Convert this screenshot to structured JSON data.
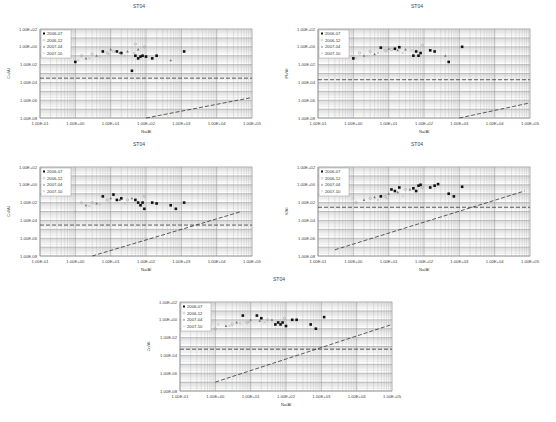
{
  "figure": {
    "caption": "",
    "station": "ST04"
  },
  "legend_entries": [
    "2006-07",
    "2006-12",
    "2007-04",
    "2007-10"
  ],
  "chart_data": [
    {
      "type": "scatter",
      "title": "ST04",
      "xlabel": "Na/Al",
      "ylabel": "Cu/Al",
      "xscale": "log",
      "yscale": "log",
      "xlim": [
        0.1,
        100000
      ],
      "ylim": [
        1e-08,
        100
      ],
      "xticks": [
        "1.00E-01",
        "1.00E+00",
        "1.00E+01",
        "1.00E+02",
        "1.00E+03",
        "1.00E+04",
        "1.00E+05"
      ],
      "yticks": [
        "1.00E+02",
        "1.00E+00",
        "1.00E-02",
        "1.00E-04",
        "1.00E-06",
        "1.00E-08"
      ],
      "legend": [
        "2006-07",
        "2006-12",
        "2007-04",
        "2007-10"
      ],
      "legend_position": "upper-left",
      "grid": true,
      "hline": 0.0003,
      "diag_line": [
        [
          100,
          1e-08
        ],
        [
          100000,
          2e-06
        ]
      ],
      "series": [
        {
          "name": "2006-07",
          "marker": "filled-square",
          "points": [
            [
              1,
              0.02
            ],
            [
              6,
              0.3
            ],
            [
              15,
              0.3
            ],
            [
              20,
              0.2
            ],
            [
              50,
              0.1
            ],
            [
              60,
              0.05
            ],
            [
              70,
              0.08
            ],
            [
              80,
              0.1
            ],
            [
              100,
              0.08
            ],
            [
              150,
              0.05
            ],
            [
              200,
              0.1
            ],
            [
              1200,
              0.3
            ],
            [
              40,
              0.002
            ]
          ]
        },
        {
          "name": "2006-12",
          "marker": "open-circle",
          "points": [
            [
              1.5,
              0.1
            ],
            [
              3,
              0.15
            ],
            [
              8,
              0.2
            ],
            [
              12,
              0.3
            ],
            [
              50,
              2
            ],
            [
              90,
              1
            ]
          ]
        },
        {
          "name": "2007-04",
          "marker": "triangle",
          "points": [
            [
              2,
              0.05
            ],
            [
              4,
              0.1
            ],
            [
              10,
              0.5
            ],
            [
              18,
              0.2
            ],
            [
              30,
              0.3
            ],
            [
              60,
              0.5
            ],
            [
              500,
              0.03
            ]
          ]
        },
        {
          "name": "2007-10",
          "marker": "cross",
          "points": [
            [
              1.2,
              0.03
            ],
            [
              2.5,
              0.05
            ],
            [
              5,
              0.08
            ],
            [
              9,
              0.15
            ],
            [
              25,
              0.1
            ],
            [
              45,
              0.2
            ]
          ]
        }
      ]
    },
    {
      "type": "scatter",
      "title": "ST04",
      "xlabel": "Na/Al",
      "ylabel": "Pb/Al",
      "xscale": "log",
      "yscale": "log",
      "xlim": [
        0.1,
        100000
      ],
      "ylim": [
        1e-08,
        100
      ],
      "xticks": [
        "1.00E-01",
        "1.00E+00",
        "1.00E+01",
        "1.00E+02",
        "1.00E+03",
        "1.00E+04",
        "1.00E+05"
      ],
      "yticks": [
        "1.00E+02",
        "1.00E+00",
        "1.00E-02",
        "1.00E-04",
        "1.00E-06",
        "1.00E-08"
      ],
      "legend": [
        "2006-07",
        "2006-12",
        "2007-04",
        "2007-10"
      ],
      "legend_position": "upper-left",
      "grid": true,
      "hline": 0.0002,
      "diag_line": [
        [
          1000,
          1e-08
        ],
        [
          100000,
          5e-07
        ]
      ],
      "series": [
        {
          "name": "2006-07",
          "marker": "filled-square",
          "points": [
            [
              1,
              0.05
            ],
            [
              6,
              0.8
            ],
            [
              15,
              0.6
            ],
            [
              20,
              0.9
            ],
            [
              50,
              0.1
            ],
            [
              60,
              0.3
            ],
            [
              70,
              0.1
            ],
            [
              80,
              0.2
            ],
            [
              150,
              0.4
            ],
            [
              200,
              0.3
            ],
            [
              500,
              0.02
            ],
            [
              1200,
              1
            ]
          ]
        },
        {
          "name": "2006-12",
          "marker": "open-circle",
          "points": [
            [
              1.5,
              0.2
            ],
            [
              3,
              0.3
            ],
            [
              8,
              0.4
            ],
            [
              12,
              0.5
            ],
            [
              90,
              1.5
            ]
          ]
        },
        {
          "name": "2007-04",
          "marker": "triangle",
          "points": [
            [
              2,
              0.1
            ],
            [
              4,
              0.15
            ],
            [
              10,
              0.6
            ],
            [
              18,
              0.4
            ],
            [
              30,
              0.5
            ],
            [
              400,
              0.1
            ]
          ]
        },
        {
          "name": "2007-10",
          "marker": "cross",
          "points": [
            [
              1.2,
              0.05
            ],
            [
              2.5,
              0.1
            ],
            [
              5,
              0.2
            ],
            [
              9,
              0.3
            ],
            [
              25,
              0.2
            ],
            [
              45,
              0.4
            ]
          ]
        }
      ]
    },
    {
      "type": "scatter",
      "title": "ST04",
      "xlabel": "Na/Al",
      "ylabel": "Cd/Al",
      "xscale": "log",
      "yscale": "log",
      "xlim": [
        0.1,
        100000
      ],
      "ylim": [
        1e-08,
        100
      ],
      "xticks": [
        "1.00E-01",
        "1.00E+00",
        "1.00E+01",
        "1.00E+02",
        "1.00E+03",
        "1.00E+04",
        "1.00E+05"
      ],
      "yticks": [
        "1.00E+02",
        "1.00E+00",
        "1.00E-02",
        "1.00E-04",
        "1.00E-06",
        "1.00E-08"
      ],
      "legend": [
        "2006-07",
        "2006-12",
        "2007-04",
        "2007-10"
      ],
      "legend_position": "upper-left",
      "grid": true,
      "hline": 3e-05,
      "diag_line": [
        [
          3,
          1e-08
        ],
        [
          50000,
          0.001
        ]
      ],
      "series": [
        {
          "name": "2006-07",
          "marker": "filled-square",
          "points": [
            [
              6,
              0.05
            ],
            [
              12,
              0.08
            ],
            [
              15,
              0.02
            ],
            [
              20,
              0.03
            ],
            [
              50,
              0.02
            ],
            [
              60,
              0.01
            ],
            [
              70,
              0.005
            ],
            [
              80,
              0.01
            ],
            [
              90,
              0.002
            ],
            [
              150,
              0.01
            ],
            [
              200,
              0.008
            ],
            [
              500,
              0.005
            ],
            [
              700,
              0.002
            ],
            [
              1200,
              0.01
            ]
          ]
        },
        {
          "name": "2006-12",
          "marker": "open-circle",
          "points": [
            [
              1.5,
              0.01
            ],
            [
              3,
              0.01
            ],
            [
              8,
              0.02
            ],
            [
              30,
              0.02
            ],
            [
              90,
              0.05
            ]
          ]
        },
        {
          "name": "2007-04",
          "marker": "triangle",
          "points": [
            [
              2,
              0.005
            ],
            [
              4,
              0.008
            ],
            [
              10,
              0.03
            ],
            [
              18,
              0.02
            ],
            [
              40,
              0.03
            ]
          ]
        },
        {
          "name": "2007-10",
          "marker": "cross",
          "points": [
            [
              1.0,
              0.001
            ],
            [
              2.5,
              0.004
            ],
            [
              5,
              0.006
            ],
            [
              9,
              0.01
            ],
            [
              25,
              0.008
            ]
          ]
        }
      ]
    },
    {
      "type": "scatter",
      "title": "ST04",
      "xlabel": "Na/Al",
      "ylabel": "V/Al",
      "xscale": "log",
      "yscale": "log",
      "xlim": [
        0.1,
        100000
      ],
      "ylim": [
        1e-08,
        100
      ],
      "xticks": [
        "1.00E-01",
        "1.00E+00",
        "1.00E+01",
        "1.00E+02",
        "1.00E+03",
        "1.00E+04",
        "1.00E+05"
      ],
      "yticks": [
        "1.00E+02",
        "1.00E+00",
        "1.00E-02",
        "1.00E-04",
        "1.00E-06",
        "1.00E-08"
      ],
      "legend": [
        "2006-07",
        "2006-12",
        "2007-04",
        "2007-10"
      ],
      "legend_position": "upper-left",
      "grid": true,
      "hline": 0.003,
      "diag_line": [
        [
          0.3,
          5e-08
        ],
        [
          70000,
          0.2
        ]
      ],
      "series": [
        {
          "name": "2006-07",
          "marker": "filled-square",
          "points": [
            [
              6,
              0.05
            ],
            [
              12,
              0.3
            ],
            [
              15,
              0.2
            ],
            [
              20,
              0.5
            ],
            [
              50,
              0.4
            ],
            [
              60,
              0.2
            ],
            [
              70,
              0.8
            ],
            [
              80,
              1
            ],
            [
              150,
              0.5
            ],
            [
              200,
              0.8
            ],
            [
              250,
              1.2
            ],
            [
              500,
              0.1
            ],
            [
              700,
              0.05
            ],
            [
              1200,
              0.6
            ]
          ]
        },
        {
          "name": "2006-12",
          "marker": "open-circle",
          "points": [
            [
              1.2,
              0.01
            ],
            [
              3,
              0.03
            ],
            [
              8,
              0.05
            ],
            [
              30,
              0.3
            ],
            [
              90,
              0.5
            ]
          ]
        },
        {
          "name": "2007-04",
          "marker": "triangle",
          "points": [
            [
              2,
              0.02
            ],
            [
              4,
              0.04
            ],
            [
              10,
              0.1
            ],
            [
              18,
              0.15
            ],
            [
              40,
              0.3
            ]
          ]
        },
        {
          "name": "2007-10",
          "marker": "cross",
          "points": [
            [
              1.0,
              0.03
            ],
            [
              2.5,
              0.01
            ],
            [
              5,
              0.02
            ],
            [
              9,
              0.03
            ],
            [
              25,
              0.05
            ]
          ]
        }
      ]
    },
    {
      "type": "scatter",
      "title": "ST04",
      "xlabel": "Na/Al",
      "ylabel": "Zn/Al",
      "xscale": "log",
      "yscale": "log",
      "xlim": [
        0.1,
        100000
      ],
      "ylim": [
        1e-08,
        100
      ],
      "xticks": [
        "1.00E-01",
        "1.00E+00",
        "1.00E+01",
        "1.00E+02",
        "1.00E+03",
        "1.00E+04",
        "1.00E+05"
      ],
      "yticks": [
        "1.00E+02",
        "1.00E+00",
        "1.00E-02",
        "1.00E-04",
        "1.00E-06",
        "1.00E-08"
      ],
      "legend": [
        "2006-07",
        "2006-12",
        "2007-04",
        "2007-10"
      ],
      "legend_position": "upper-left",
      "grid": true,
      "hline": 0.0005,
      "diag_line": [
        [
          1,
          1e-07
        ],
        [
          100000,
          0.3
        ]
      ],
      "series": [
        {
          "name": "2006-07",
          "marker": "filled-square",
          "points": [
            [
              6,
              3
            ],
            [
              15,
              3
            ],
            [
              20,
              1.5
            ],
            [
              50,
              0.3
            ],
            [
              60,
              0.5
            ],
            [
              70,
              0.3
            ],
            [
              80,
              0.5
            ],
            [
              100,
              0.2
            ],
            [
              150,
              1
            ],
            [
              200,
              1
            ],
            [
              500,
              0.3
            ],
            [
              700,
              0.1
            ],
            [
              1200,
              2
            ]
          ]
        },
        {
          "name": "2006-12",
          "marker": "open-circle",
          "points": [
            [
              1,
              0.1
            ],
            [
              3,
              0.3
            ],
            [
              8,
              0.5
            ],
            [
              30,
              1
            ],
            [
              90,
              1.5
            ]
          ]
        },
        {
          "name": "2007-04",
          "marker": "triangle",
          "points": [
            [
              2,
              0.2
            ],
            [
              4,
              0.5
            ],
            [
              10,
              1
            ],
            [
              18,
              0.8
            ],
            [
              40,
              1
            ]
          ]
        },
        {
          "name": "2007-10",
          "marker": "cross",
          "points": [
            [
              1.2,
              0.3
            ],
            [
              2.5,
              0.2
            ],
            [
              5,
              0.4
            ],
            [
              9,
              0.6
            ],
            [
              25,
              0.5
            ]
          ]
        }
      ]
    }
  ]
}
